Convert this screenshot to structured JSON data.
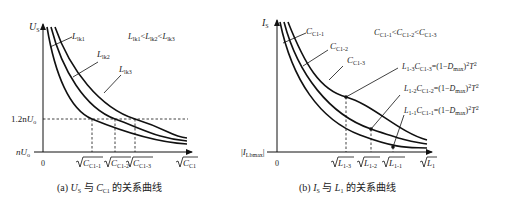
{
  "figure_a": {
    "y_axis_label": "U",
    "y_axis_label_sub": "S",
    "x_axis_label": "C",
    "x_axis_label_sub": "C1",
    "origin_label": "0",
    "y_ref_high_prefix": "1.2n",
    "y_ref_high_var": "U",
    "y_ref_high_sub": "o",
    "y_ref_low_prefix": "n",
    "y_ref_low_var": "U",
    "y_ref_low_sub": "o",
    "curves": [
      {
        "label": "L",
        "sub": "lk1"
      },
      {
        "label": "L",
        "sub": "lk2"
      },
      {
        "label": "L",
        "sub": "lk3"
      }
    ],
    "relation": {
      "a": "lk1",
      "b": "lk2",
      "c": "lk3",
      "var": "L",
      "op": "<"
    },
    "x_ticks": [
      {
        "var": "C",
        "sub": "C1-1"
      },
      {
        "var": "C",
        "sub": "C1-2"
      },
      {
        "var": "C",
        "sub": "C1-3"
      }
    ],
    "caption": {
      "prefix": "(a) ",
      "v1": "U",
      "v1sub": "S",
      "mid": " 与 ",
      "v2": "C",
      "v2sub": "C1",
      "suffix": " 的关系曲线"
    }
  },
  "figure_b": {
    "y_axis_label": "I",
    "y_axis_label_sub": "S",
    "x_axis_label": "L",
    "x_axis_label_sub": "1",
    "origin_label": "0",
    "y_ref_var": "I",
    "y_ref_sub": "Lbmax",
    "curves": [
      {
        "label": "C",
        "sub": "C1-1"
      },
      {
        "label": "C",
        "sub": "C1-2"
      },
      {
        "label": "C",
        "sub": "C1-3"
      }
    ],
    "relation": {
      "a": "C1-1",
      "b": "C1-2",
      "c": "C1-3",
      "var": "C",
      "op": "<"
    },
    "equations": [
      {
        "L": "1-3",
        "C": "C1-3",
        "rhs_a": "=(1−",
        "D": "D",
        "Dsub": "max",
        "rhs_b": ")",
        "T": "T"
      },
      {
        "L": "1-2",
        "C": "C1-2",
        "rhs_a": "=(1−",
        "D": "D",
        "Dsub": "max",
        "rhs_b": ")",
        "T": "T"
      },
      {
        "L": "1-1",
        "C": "C1-1",
        "rhs_a": "=(1−",
        "D": "D",
        "Dsub": "max",
        "rhs_b": ")",
        "T": "T"
      }
    ],
    "x_ticks": [
      {
        "var": "L",
        "sub": "1-3"
      },
      {
        "var": "L",
        "sub": "1-2"
      },
      {
        "var": "L",
        "sub": "1-1"
      }
    ],
    "caption": {
      "prefix": "(b) ",
      "v1": "I",
      "v1sub": "S",
      "mid": " 与 ",
      "v2": "L",
      "v2sub": "1",
      "suffix": " 的关系曲线"
    }
  }
}
